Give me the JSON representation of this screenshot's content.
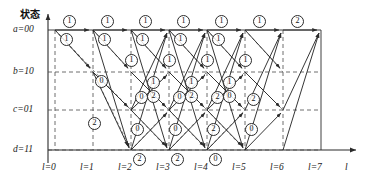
{
  "figure": {
    "type": "trellis-diagram",
    "y_axis_title": "状态",
    "x_axis_title": "l",
    "states": [
      {
        "id": "a",
        "label": "a=00",
        "y": 30
      },
      {
        "id": "b",
        "label": "b=10",
        "y": 72
      },
      {
        "id": "c",
        "label": "c=01",
        "y": 110
      },
      {
        "id": "d",
        "label": "d=11",
        "y": 150
      }
    ],
    "stages": [
      {
        "label": "l=0",
        "x": 55
      },
      {
        "label": "l=1",
        "x": 93
      },
      {
        "label": "l=2",
        "x": 131
      },
      {
        "label": "l=3",
        "x": 169
      },
      {
        "label": "l=4",
        "x": 207
      },
      {
        "label": "l=5",
        "x": 245
      },
      {
        "label": "l=6",
        "x": 283
      },
      {
        "label": "l=7",
        "x": 321
      }
    ],
    "metric_labels": [
      {
        "text": "①",
        "x": 68,
        "y": 20
      },
      {
        "text": "①",
        "x": 106,
        "y": 20
      },
      {
        "text": "①",
        "x": 144,
        "y": 20
      },
      {
        "text": "①",
        "x": 182,
        "y": 20
      },
      {
        "text": "①",
        "x": 220,
        "y": 20
      },
      {
        "text": "①",
        "x": 258,
        "y": 20
      },
      {
        "text": "②",
        "x": 296,
        "y": 20
      },
      {
        "text": "①",
        "x": 65,
        "y": 38
      },
      {
        "text": "①",
        "x": 103,
        "y": 38
      },
      {
        "text": "①",
        "x": 141,
        "y": 38
      },
      {
        "text": "①",
        "x": 179,
        "y": 38
      },
      {
        "text": "①",
        "x": 217,
        "y": 38
      },
      {
        "text": "①",
        "x": 130,
        "y": 59
      },
      {
        "text": "①",
        "x": 168,
        "y": 59
      },
      {
        "text": "①",
        "x": 206,
        "y": 59
      },
      {
        "text": "①",
        "x": 244,
        "y": 59
      },
      {
        "text": "⓪",
        "x": 100,
        "y": 80
      },
      {
        "text": "①",
        "x": 152,
        "y": 81
      },
      {
        "text": "①",
        "x": 190,
        "y": 81
      },
      {
        "text": "①",
        "x": 228,
        "y": 81
      },
      {
        "text": "⓪",
        "x": 140,
        "y": 96
      },
      {
        "text": "②",
        "x": 152,
        "y": 95
      },
      {
        "text": "⓪",
        "x": 178,
        "y": 96
      },
      {
        "text": "②",
        "x": 190,
        "y": 95
      },
      {
        "text": "②",
        "x": 216,
        "y": 96
      },
      {
        "text": "⓪",
        "x": 228,
        "y": 95
      },
      {
        "text": "②",
        "x": 252,
        "y": 98
      },
      {
        "text": "②",
        "x": 93,
        "y": 122
      },
      {
        "text": "⓪",
        "x": 136,
        "y": 128
      },
      {
        "text": "⓪",
        "x": 174,
        "y": 128
      },
      {
        "text": "②",
        "x": 212,
        "y": 128
      },
      {
        "text": "⓪",
        "x": 250,
        "y": 128
      },
      {
        "text": "②",
        "x": 138,
        "y": 158
      },
      {
        "text": "②",
        "x": 176,
        "y": 158
      },
      {
        "text": "⓪",
        "x": 214,
        "y": 158
      }
    ],
    "colors": {
      "line": "#2b2b2b",
      "dashed": "#5a5a5a",
      "text": "#111111",
      "background": "#ffffff"
    }
  }
}
